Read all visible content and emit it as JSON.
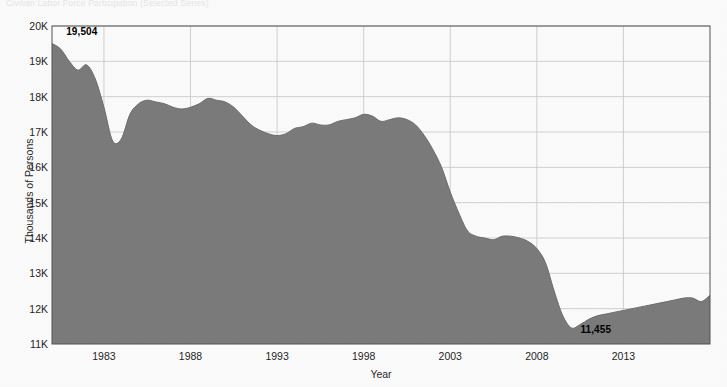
{
  "figure": {
    "cropped_header_text": "Civilian Labor Force Participation (Selected Series)",
    "background_color": "#ffffff"
  },
  "chart_data": {
    "type": "area",
    "title": "",
    "xlabel": "Year",
    "ylabel": "Thousands of Persons",
    "series_name": "Persons",
    "fill_color": "#7d7d7d",
    "line_color": "#6e6e6e",
    "grid": true,
    "grid_color": "#c8c8c8",
    "legend": "none",
    "xlim": [
      1980,
      2018
    ],
    "ylim": [
      11000,
      20000
    ],
    "y_ticks": [
      11000,
      12000,
      13000,
      14000,
      15000,
      16000,
      17000,
      18000,
      19000,
      20000
    ],
    "y_tick_labels": [
      "11K",
      "12K",
      "13K",
      "14K",
      "15K",
      "16K",
      "17K",
      "18K",
      "19K",
      "20K"
    ],
    "x_ticks": [
      1983,
      1988,
      1993,
      1998,
      2003,
      2008,
      2013
    ],
    "x_tick_labels": [
      "1983",
      "1988",
      "1993",
      "1998",
      "2003",
      "2008",
      "2013"
    ],
    "annotations": [
      {
        "name": "start-value",
        "text": "19,504",
        "x": 1980.3,
        "y": 19504
      },
      {
        "name": "minimum-value",
        "text": "11,455",
        "x": 2010.0,
        "y": 11455
      }
    ],
    "x": [
      1980.0,
      1980.5,
      1981.0,
      1981.5,
      1982.0,
      1982.5,
      1983.0,
      1983.5,
      1984.0,
      1984.5,
      1985.0,
      1985.5,
      1986.0,
      1986.5,
      1987.0,
      1987.5,
      1988.0,
      1988.5,
      1989.0,
      1989.5,
      1990.0,
      1990.5,
      1991.0,
      1991.5,
      1992.0,
      1992.5,
      1993.0,
      1993.5,
      1994.0,
      1994.5,
      1995.0,
      1995.5,
      1996.0,
      1996.5,
      1997.0,
      1997.5,
      1998.0,
      1998.5,
      1999.0,
      1999.5,
      2000.0,
      2000.5,
      2001.0,
      2001.5,
      2002.0,
      2002.5,
      2003.0,
      2003.5,
      2004.0,
      2004.5,
      2005.0,
      2005.5,
      2006.0,
      2006.5,
      2007.0,
      2007.5,
      2008.0,
      2008.5,
      2009.0,
      2009.5,
      2010.0,
      2010.5,
      2011.0,
      2011.5,
      2012.0,
      2012.5,
      2013.0,
      2013.5,
      2014.0,
      2014.5,
      2015.0,
      2015.5,
      2016.0,
      2016.5,
      2017.0,
      2017.5,
      2018.0
    ],
    "values": [
      19504,
      19350,
      19000,
      18750,
      18900,
      18500,
      17700,
      16750,
      16800,
      17500,
      17800,
      17900,
      17850,
      17800,
      17700,
      17650,
      17700,
      17800,
      17950,
      17900,
      17850,
      17700,
      17450,
      17200,
      17050,
      16950,
      16900,
      16950,
      17100,
      17150,
      17250,
      17200,
      17200,
      17300,
      17350,
      17400,
      17500,
      17450,
      17300,
      17350,
      17400,
      17350,
      17200,
      16900,
      16500,
      16000,
      15300,
      14700,
      14200,
      14050,
      14000,
      13950,
      14050,
      14050,
      14000,
      13900,
      13700,
      13300,
      12500,
      11800,
      11455,
      11550,
      11700,
      11800,
      11850,
      11900,
      11950,
      12000,
      12050,
      12100,
      12150,
      12200,
      12250,
      12300,
      12300,
      12200,
      12380
    ]
  }
}
